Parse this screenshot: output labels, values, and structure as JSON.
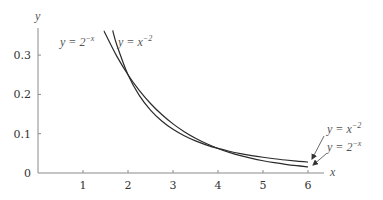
{
  "chart_data": {
    "type": "line",
    "title": "",
    "xlabel": "x",
    "ylabel": "y",
    "xlim": [
      0,
      6
    ],
    "ylim": [
      0,
      0.36
    ],
    "grid": false,
    "xticks": [
      "1",
      "2",
      "3",
      "4",
      "5",
      "6"
    ],
    "xtick_values": [
      1,
      2,
      3,
      4,
      5,
      6
    ],
    "yticks": [
      "0",
      "0.1",
      "0.2",
      "0.3"
    ],
    "ytick_values": [
      0,
      0.1,
      0.2,
      0.3
    ],
    "series": [
      {
        "name": "y = 2^{-x}",
        "x": [
          1.47,
          1.5,
          1.75,
          2,
          2.25,
          2.5,
          2.75,
          3,
          3.25,
          3.5,
          3.75,
          4,
          4.25,
          4.5,
          4.75,
          5,
          5.25,
          5.5,
          5.75,
          6
        ],
        "values": [
          0.361,
          0.3536,
          0.2973,
          0.25,
          0.2102,
          0.1768,
          0.1487,
          0.125,
          0.1051,
          0.0884,
          0.0743,
          0.0625,
          0.0526,
          0.0442,
          0.0372,
          0.03125,
          0.0263,
          0.0221,
          0.0186,
          0.0156
        ]
      },
      {
        "name": "y = x^{-2}",
        "x": [
          1.66,
          1.75,
          2,
          2.25,
          2.5,
          2.75,
          3,
          3.25,
          3.5,
          3.75,
          4,
          4.25,
          4.5,
          4.75,
          5,
          5.25,
          5.5,
          5.75,
          6
        ],
        "values": [
          0.3629,
          0.3265,
          0.25,
          0.1975,
          0.16,
          0.1322,
          0.1111,
          0.0947,
          0.0816,
          0.0711,
          0.0625,
          0.0554,
          0.0494,
          0.0443,
          0.04,
          0.0363,
          0.0331,
          0.0302,
          0.0278
        ]
      }
    ],
    "annotations": {
      "top_left": {
        "base": "y = 2",
        "exp": "−x",
        "series": "y = 2^{-x}"
      },
      "top_right": {
        "base": "y = x",
        "exp": "−2",
        "series": "y = x^{-2}"
      },
      "end_upper": {
        "base": "y = x",
        "exp": "−2",
        "series": "y = x^{-2}",
        "arrow": true
      },
      "end_lower": {
        "base": "y = 2",
        "exp": "−x",
        "series": "y = 2^{-x}",
        "arrow": true
      }
    }
  }
}
